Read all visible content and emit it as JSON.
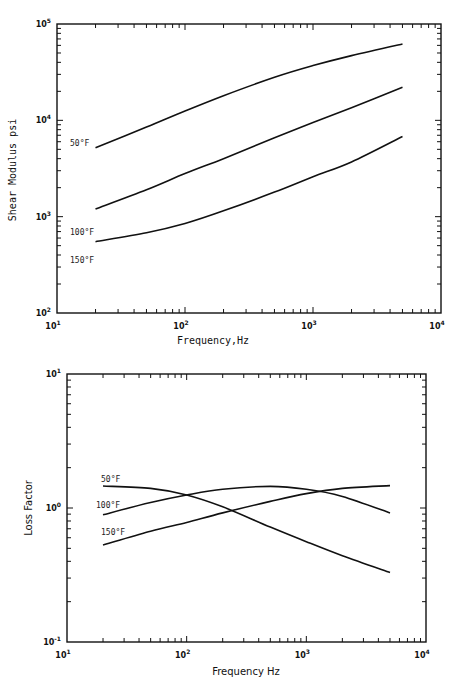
{
  "chart_data": [
    {
      "type": "line",
      "scale": "log-log",
      "title": "",
      "xlabel": "Frequency,Hz",
      "ylabel": "Shear Modulus psi",
      "xlim": [
        10,
        10000
      ],
      "ylim": [
        100,
        100000
      ],
      "x_tick_labels": [
        "10^1",
        "10^2",
        "10^3",
        "10^4"
      ],
      "y_tick_labels": [
        "10^2",
        "10^3",
        "10^4",
        "10^5"
      ],
      "grid": false,
      "legend": "inline labels at left end of curves",
      "x": [
        20,
        50,
        100,
        200,
        500,
        1000,
        2000,
        5000
      ],
      "series": [
        {
          "name": "50°F",
          "values": [
            5200,
            8500,
            12500,
            18000,
            28000,
            37000,
            47000,
            62000
          ]
        },
        {
          "name": "100°F",
          "values": [
            1200,
            1900,
            2800,
            4000,
            6600,
            9500,
            13500,
            22000
          ]
        },
        {
          "name": "150°F",
          "values": [
            550,
            680,
            850,
            1150,
            1800,
            2600,
            3700,
            6800
          ]
        }
      ]
    },
    {
      "type": "line",
      "scale": "log-log",
      "title": "",
      "xlabel": "Frequency Hz",
      "ylabel": "Loss Factor",
      "xlim": [
        10,
        10000
      ],
      "ylim": [
        0.1,
        10
      ],
      "x_tick_labels": [
        "10^1",
        "10^2",
        "10^3",
        "10^4"
      ],
      "y_tick_labels": [
        "10^-1",
        "10^0",
        "10^1"
      ],
      "grid": false,
      "legend": "inline labels at left end of curves",
      "x": [
        20,
        50,
        100,
        200,
        500,
        1000,
        2000,
        5000
      ],
      "series": [
        {
          "name": "50°F",
          "values": [
            1.46,
            1.4,
            1.25,
            1.02,
            0.72,
            0.56,
            0.44,
            0.33
          ]
        },
        {
          "name": "100°F",
          "values": [
            0.89,
            1.1,
            1.25,
            1.38,
            1.45,
            1.38,
            1.22,
            0.92
          ]
        },
        {
          "name": "150°F",
          "values": [
            0.53,
            0.67,
            0.78,
            0.92,
            1.12,
            1.28,
            1.4,
            1.47
          ]
        }
      ]
    }
  ],
  "top": {
    "ylabel": "Shear Modulus psi",
    "xlabel": "Frequency,Hz",
    "curve_labels": [
      "50°F",
      "100°F",
      "150°F"
    ],
    "xticks": [
      {
        "b": "10",
        "e": "1"
      },
      {
        "b": "10",
        "e": "2"
      },
      {
        "b": "10",
        "e": "3"
      },
      {
        "b": "10",
        "e": "4"
      }
    ],
    "yticks": [
      {
        "b": "10",
        "e": "2"
      },
      {
        "b": "10",
        "e": "3"
      },
      {
        "b": "10",
        "e": "4"
      },
      {
        "b": "10",
        "e": "5"
      }
    ]
  },
  "bottom": {
    "ylabel": "Loss Factor",
    "xlabel": "Frequency Hz",
    "curve_labels": [
      "50°F",
      "100°F",
      "150°F"
    ],
    "xticks": [
      {
        "b": "10",
        "e": "1"
      },
      {
        "b": "10",
        "e": "2"
      },
      {
        "b": "10",
        "e": "3"
      },
      {
        "b": "10",
        "e": "4"
      }
    ],
    "yticks": [
      {
        "b": "10",
        "e": "-1"
      },
      {
        "b": "10",
        "e": "0"
      },
      {
        "b": "10",
        "e": "1"
      }
    ]
  }
}
